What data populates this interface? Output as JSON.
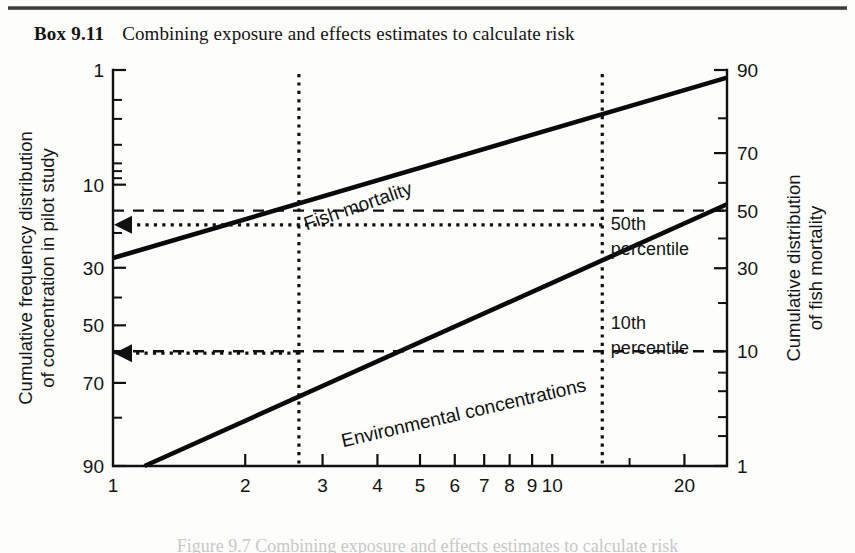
{
  "box": {
    "label": "Box 9.11",
    "title": "Combining exposure and effects estimates to calculate risk"
  },
  "caption": {
    "text": "Figure 9.7   Combining exposure and effects estimates to calculate risk"
  },
  "chart_data": {
    "type": "line",
    "title": "Combining exposure and effects estimates to calculate risk",
    "xlabel_text": "Concentration (mg l",
    "xlabel_sup": "−1",
    "xlabel_tail": ")",
    "ylabel_left": [
      "Cumulative frequency distribution",
      "of concentration in pilot study"
    ],
    "ylabel_right": [
      "Cumulative distribution",
      "of fish mortality"
    ],
    "x_scale": "log",
    "xlim": [
      1,
      25
    ],
    "x_ticks": [
      {
        "value": 1,
        "label": "1"
      },
      {
        "value": 2,
        "label": "2"
      },
      {
        "value": 3,
        "label": "3"
      },
      {
        "value": 4,
        "label": "4"
      },
      {
        "value": 5,
        "label": "5"
      },
      {
        "value": 6,
        "label": "6"
      },
      {
        "value": 7,
        "label": "7"
      },
      {
        "value": 8,
        "label": "8"
      },
      {
        "value": 9,
        "label": "9"
      },
      {
        "value": 10,
        "label": "10"
      },
      {
        "value": 20,
        "label": "20"
      }
    ],
    "x_minor_ticks": [
      15,
      25
    ],
    "y_scale": "probability",
    "y_left_label_text": "Cumulative frequency distribution of concentration in pilot study",
    "y_left_ticks": [
      {
        "value": 1,
        "label": "1"
      },
      {
        "value": 2,
        "label": ""
      },
      {
        "value": 3,
        "label": ""
      },
      {
        "value": 5,
        "label": ""
      },
      {
        "value": 7,
        "label": ""
      },
      {
        "value": 8,
        "label": ""
      },
      {
        "value": 9,
        "label": ""
      },
      {
        "value": 10,
        "label": "10"
      },
      {
        "value": 20,
        "label": ""
      },
      {
        "value": 30,
        "label": "30"
      },
      {
        "value": 40,
        "label": ""
      },
      {
        "value": 50,
        "label": "50"
      },
      {
        "value": 60,
        "label": ""
      },
      {
        "value": 70,
        "label": "70"
      },
      {
        "value": 80,
        "label": ""
      },
      {
        "value": 90,
        "label": "90"
      }
    ],
    "y_right_label_text": "Cumulative distribution of fish mortality",
    "y_right_ticks": [
      {
        "value": 90,
        "label": "90"
      },
      {
        "value": 80,
        "label": ""
      },
      {
        "value": 70,
        "label": "70"
      },
      {
        "value": 60,
        "label": ""
      },
      {
        "value": 50,
        "label": "50"
      },
      {
        "value": 40,
        "label": ""
      },
      {
        "value": 30,
        "label": "30"
      },
      {
        "value": 20,
        "label": ""
      },
      {
        "value": 10,
        "label": "10"
      },
      {
        "value": 7,
        "label": ""
      },
      {
        "value": 5,
        "label": ""
      },
      {
        "value": 3,
        "label": ""
      },
      {
        "value": 2,
        "label": ""
      },
      {
        "value": 1,
        "label": "1"
      }
    ],
    "series": [
      {
        "name": "Fish mortality",
        "style": "solid-thick",
        "label_rotation": -19,
        "points": [
          [
            1,
            27.0
          ],
          [
            25,
            1.2
          ]
        ],
        "note": "left-axis probability values; rises left-to-right on the inverted right axis"
      },
      {
        "name": "Environmental concentrations",
        "style": "solid-thick",
        "label_rotation": -13,
        "points": [
          [
            1.18,
            90.0
          ],
          [
            25,
            13.5
          ]
        ],
        "note": "lower line, left-axis probability values"
      }
    ],
    "reference_lines": [
      {
        "name": "50th-percentile-horizontal",
        "style": "dashed",
        "orientation": "horizontal",
        "y_value": 50,
        "axis": "right",
        "label": "50th percentile"
      },
      {
        "name": "10th-percentile-horizontal",
        "style": "dashed",
        "orientation": "horizontal",
        "y_value": 10,
        "axis": "right",
        "label": "10th percentile"
      },
      {
        "name": "50th-percentile-vertical",
        "style": "dotted",
        "orientation": "vertical",
        "x_value": 13.0
      },
      {
        "name": "10th-percentile-vertical",
        "style": "dotted",
        "orientation": "vertical",
        "x_value": 2.65
      }
    ],
    "annotations": [
      {
        "name": "50th-percentile",
        "text": "50th percentile",
        "x_value": 13.6,
        "y_value": 43
      },
      {
        "name": "10th-percentile",
        "text": "10th percentile",
        "x_value": 13.6,
        "y_value": 14
      }
    ],
    "arrows": [
      {
        "name": "upper-risk-arrow",
        "from_x": 13.0,
        "to_x": 1.0,
        "y_left_value": 18.0,
        "direction": "left",
        "style": "dotted"
      },
      {
        "name": "lower-risk-arrow",
        "from_x": 2.65,
        "to_x": 1.0,
        "y_left_value": 60.0,
        "direction": "left",
        "style": "dotted"
      }
    ],
    "grid": false,
    "legend": "none",
    "colors": {
      "ink": "#111111",
      "background": "#fdfdfc"
    }
  }
}
